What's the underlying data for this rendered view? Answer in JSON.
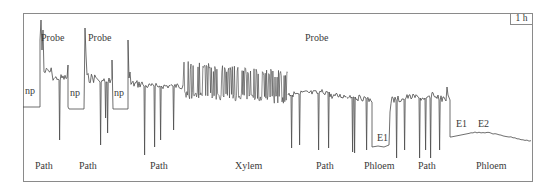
{
  "chart_data": {
    "type": "line",
    "title": "",
    "xlabel": "",
    "ylabel": "",
    "grid": false,
    "legend": null,
    "scale_bar": "1 h",
    "colors": {
      "trace": "#4a4a4a",
      "frame": "#8a8a8a",
      "text": "#3a3a3a"
    },
    "top_annotations": [
      {
        "label": "Probe",
        "x": 41
      },
      {
        "label": "Probe",
        "x": 88
      },
      {
        "label": "Probe",
        "x": 305
      }
    ],
    "inline_annotations": [
      {
        "label": "np",
        "x": 25,
        "y": 90
      },
      {
        "label": "np",
        "x": 70,
        "y": 92
      },
      {
        "label": "np",
        "x": 114,
        "y": 92
      },
      {
        "label": "E1",
        "x": 377,
        "y": 137
      },
      {
        "label": "E1",
        "x": 456,
        "y": 123
      },
      {
        "label": "E2",
        "x": 478,
        "y": 123
      }
    ],
    "bottom_annotations": [
      {
        "label": "Path",
        "x": 35
      },
      {
        "label": "Path",
        "x": 79
      },
      {
        "label": "Path",
        "x": 150
      },
      {
        "label": "Xylem",
        "x": 235
      },
      {
        "label": "Path",
        "x": 316
      },
      {
        "label": "Phloem",
        "x": 364
      },
      {
        "label": "Path",
        "x": 418
      },
      {
        "label": "Phloem",
        "x": 476
      }
    ],
    "segments": [
      {
        "phase": "np",
        "x_start": 23,
        "x_end": 40,
        "level": 107
      },
      {
        "phase": "Probe/Path",
        "x_start": 40,
        "x_end": 68,
        "level": 77
      },
      {
        "phase": "np",
        "x_start": 68,
        "x_end": 84,
        "level": 109
      },
      {
        "phase": "Probe/Path",
        "x_start": 84,
        "x_end": 113,
        "level": 84
      },
      {
        "phase": "np",
        "x_start": 113,
        "x_end": 128,
        "level": 109
      },
      {
        "phase": "Path",
        "x_start": 128,
        "x_end": 183,
        "level": 86
      },
      {
        "phase": "Xylem",
        "x_start": 183,
        "x_end": 288,
        "level": 83
      },
      {
        "phase": "Path",
        "x_start": 288,
        "x_end": 372,
        "level": 95
      },
      {
        "phase": "Phloem (E1)",
        "x_start": 372,
        "x_end": 390,
        "level": 147
      },
      {
        "phase": "Path",
        "x_start": 390,
        "x_end": 450,
        "level": 98
      },
      {
        "phase": "Phloem (E1/E2)",
        "x_start": 450,
        "x_end": 532,
        "level": 134
      }
    ]
  },
  "scale": {
    "label": "1 h"
  }
}
